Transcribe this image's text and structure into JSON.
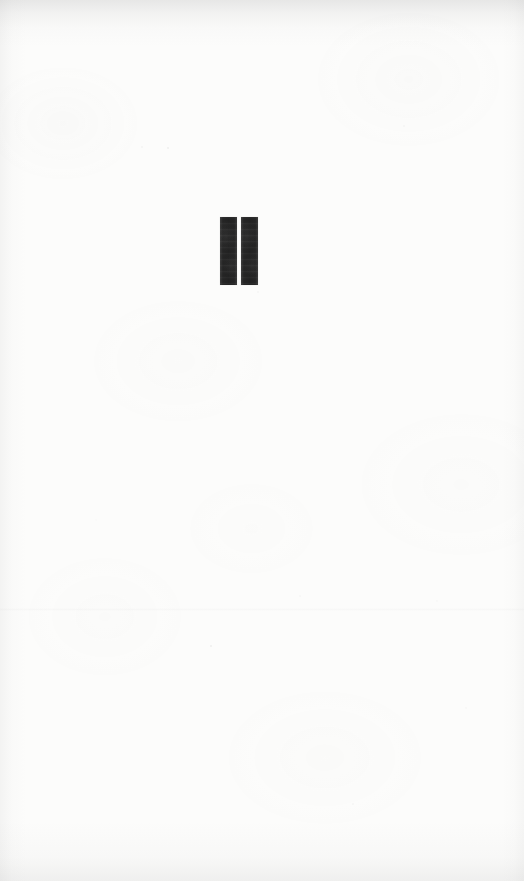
{
  "page": {
    "kind": "part-title-page",
    "background_color": "#fcfcfb",
    "width": 524,
    "height": 881
  },
  "part_title": {
    "numeral_text": "II",
    "numeral_value": 2,
    "ink_color": "#262626",
    "stroke_count": 2,
    "strokes": [
      {
        "label": "I"
      },
      {
        "label": "I"
      }
    ]
  },
  "artifacts": {
    "top_edge_shadow": true,
    "bottom_edge_shadow": true,
    "left_edge_shadow": true,
    "right_edge_shadow": true,
    "paper_grain": true,
    "speckles": true
  }
}
